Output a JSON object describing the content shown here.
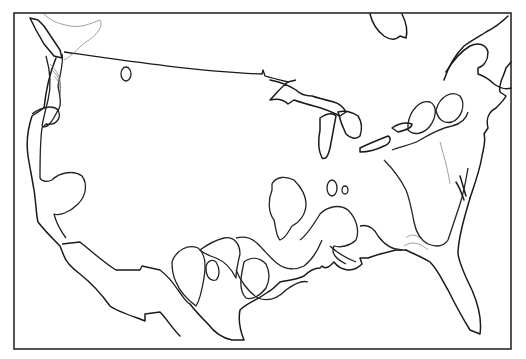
{
  "map": {
    "type": "line-art contour map",
    "region": "Contiguous United States",
    "style": "black and white hachured contour lines",
    "colors": {
      "background": "#ffffff",
      "lines": "#1a1a1a",
      "frame": "#2a2a2a"
    },
    "frame": {
      "x": 14,
      "y": 13,
      "width": 497,
      "height": 336
    },
    "features": [
      "coastline",
      "canada-us border",
      "mexico-us border",
      "great lakes",
      "hachured contour regions",
      "isolated closed contours"
    ]
  }
}
